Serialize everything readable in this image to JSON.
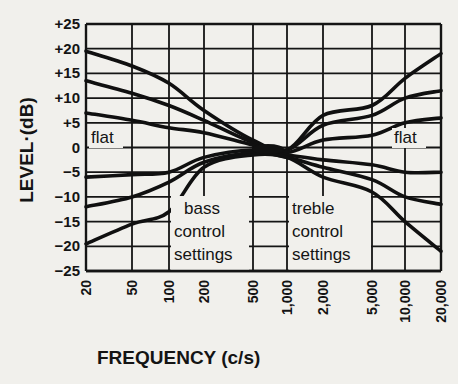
{
  "chart_data": {
    "type": "line",
    "title": "",
    "xlabel": "FREQUENCY (c/s)",
    "ylabel": "LEVEL·(dB)",
    "xscale": "log",
    "x": [
      20,
      50,
      100,
      200,
      500,
      1000,
      2000,
      5000,
      10000,
      20000
    ],
    "x_tick_labels": [
      "20",
      "50",
      "100",
      "200",
      "500",
      "1,000",
      "2,000",
      "5,000",
      "10,000",
      "20,000"
    ],
    "y_ticks": [
      25,
      20,
      15,
      10,
      5,
      0,
      -5,
      -10,
      -15,
      -20,
      -25
    ],
    "y_tick_labels": [
      "+25",
      "+20",
      "+15",
      "+10",
      "+5",
      "0",
      "-5",
      "-10",
      "-15",
      "-20",
      "-25"
    ],
    "ylim": [
      -25,
      25
    ],
    "xlim": [
      20,
      20000
    ],
    "grid": true,
    "legend": null,
    "series": [
      {
        "name": "max boost",
        "values": [
          19.5,
          16.5,
          13,
          7.5,
          1.5,
          -0.5,
          6.5,
          8.5,
          14,
          19
        ]
      },
      {
        "name": "mid boost",
        "values": [
          13.5,
          11,
          8.5,
          5.5,
          1,
          -0.5,
          4.5,
          6.5,
          10,
          11.5
        ]
      },
      {
        "name": "small boost",
        "values": [
          7,
          5.5,
          4,
          3,
          0.5,
          -1,
          1.5,
          2.5,
          5,
          6
        ]
      },
      {
        "name": "small cut",
        "values": [
          -6,
          -5.5,
          -5,
          -2,
          -0.5,
          -1.5,
          -2.5,
          -3.5,
          -5,
          -5
        ]
      },
      {
        "name": "mid cut",
        "values": [
          -12,
          -10,
          -7,
          -3,
          -1,
          -2,
          -4,
          -6.5,
          -10,
          -11.5
        ]
      },
      {
        "name": "max cut",
        "values": [
          -19.5,
          -15.5,
          -13,
          -4,
          -1.5,
          -2,
          -6,
          -9,
          -15,
          -21
        ]
      }
    ],
    "annotations": [
      {
        "text": "flat",
        "position": "left, +3 dB"
      },
      {
        "text": "flat",
        "position": "right, +3 dB"
      },
      {
        "text": "bass control settings",
        "lines": [
          "bass",
          "control",
          "settings"
        ],
        "position": "between 100 and 500 c/s, -10 to -25 dB"
      },
      {
        "text": "treble control settings",
        "lines": [
          "treble",
          "control",
          "settings"
        ],
        "position": "between 1,000 and 5,000 c/s, -10 to -25 dB"
      }
    ]
  },
  "labels": {
    "flat_left": "flat",
    "flat_right": "flat",
    "bass": [
      "bass",
      "control",
      "settings"
    ],
    "treble": [
      "treble",
      "control",
      "settings"
    ]
  }
}
